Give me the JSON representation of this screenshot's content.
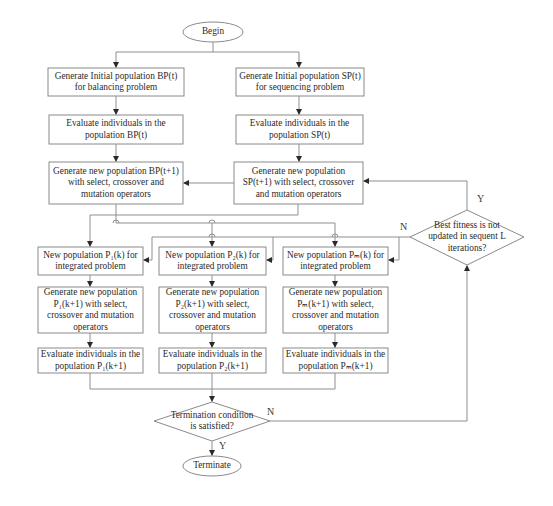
{
  "diagram": {
    "type": "flowchart",
    "nodes": {
      "begin": {
        "shape": "ellipse",
        "label": "Begin"
      },
      "init_bp": {
        "shape": "rect",
        "label": "Generate  Initial population BP(t)\nfor balancing problem"
      },
      "init_sp": {
        "shape": "rect",
        "label": "Generate  Initial population SP(t)\nfor sequencing problem"
      },
      "eval_bp": {
        "shape": "rect",
        "label": "Evaluate individuals in the\npopulation BP(t)"
      },
      "eval_sp": {
        "shape": "rect",
        "label": "Evaluate individuals in the\npopulation SP(t)"
      },
      "gen_bp": {
        "shape": "rect",
        "label": "Generate new population BP(t+1)\nwith select, crossover and\nmutation operators"
      },
      "gen_sp": {
        "shape": "rect",
        "label": "Generate new population\nSP(t+1) with select, crossover\nand mutation operators"
      },
      "best_fitness": {
        "shape": "diamond",
        "label": "Best fitness is not\nupdated in sequent L\niterations?"
      },
      "new_p1": {
        "shape": "rect",
        "label": "New population P₁(k) for\nintegrated problem"
      },
      "new_p2": {
        "shape": "rect",
        "label": "New population P₂(k) for\nintegrated problem"
      },
      "new_pm": {
        "shape": "rect",
        "label": "New population Pₘ(k) for\nintegrated problem"
      },
      "gen_p1": {
        "shape": "rect",
        "label": "Generate new population\nP₁(k+1) with select,\ncrossover and mutation\noperators"
      },
      "gen_p2": {
        "shape": "rect",
        "label": "Generate new population\nP₂(k+1) with select,\ncrossover and mutation\noperators"
      },
      "gen_pm": {
        "shape": "rect",
        "label": "Generate new population\nPₘ(k+1) with select,\ncrossover and mutation\noperators"
      },
      "eval_p1": {
        "shape": "rect",
        "label": "Evaluate individuals in the\npopulation P₁(k+1)"
      },
      "eval_p2": {
        "shape": "rect",
        "label": "Evaluate individuals in the\npopulation P₂(k+1)"
      },
      "eval_pm": {
        "shape": "rect",
        "label": "Evaluate individuals in the\npopulation Pₘ(k+1)"
      },
      "termination": {
        "shape": "diamond",
        "label": "Termination condition\nis satisfied?"
      },
      "terminate": {
        "shape": "ellipse",
        "label": "Terminate"
      }
    },
    "edge_labels": {
      "best_fitness_yes": "Y",
      "best_fitness_no": "N",
      "termination_yes": "Y",
      "termination_no": "N"
    },
    "edges": [
      [
        "begin",
        "init_bp"
      ],
      [
        "begin",
        "init_sp"
      ],
      [
        "init_bp",
        "eval_bp"
      ],
      [
        "init_sp",
        "eval_sp"
      ],
      [
        "eval_bp",
        "gen_bp"
      ],
      [
        "eval_sp",
        "gen_sp"
      ],
      [
        "gen_sp",
        "gen_bp"
      ],
      [
        "gen_bp",
        "new_p1"
      ],
      [
        "gen_bp",
        "new_p2"
      ],
      [
        "gen_bp",
        "new_pm"
      ],
      [
        "gen_sp",
        "new_p1"
      ],
      [
        "gen_sp",
        "new_p2"
      ],
      [
        "gen_sp",
        "new_pm"
      ],
      [
        "best_fitness",
        "new_p1",
        "N"
      ],
      [
        "best_fitness",
        "new_p2",
        "N"
      ],
      [
        "best_fitness",
        "new_pm",
        "N"
      ],
      [
        "best_fitness",
        "gen_sp",
        "Y"
      ],
      [
        "new_p1",
        "gen_p1"
      ],
      [
        "new_p2",
        "gen_p2"
      ],
      [
        "new_pm",
        "gen_pm"
      ],
      [
        "gen_p1",
        "eval_p1"
      ],
      [
        "gen_p2",
        "eval_p2"
      ],
      [
        "gen_pm",
        "eval_pm"
      ],
      [
        "eval_p1",
        "termination"
      ],
      [
        "eval_p2",
        "termination"
      ],
      [
        "eval_pm",
        "termination"
      ],
      [
        "termination",
        "terminate",
        "Y"
      ],
      [
        "termination",
        "best_fitness",
        "N"
      ]
    ]
  }
}
